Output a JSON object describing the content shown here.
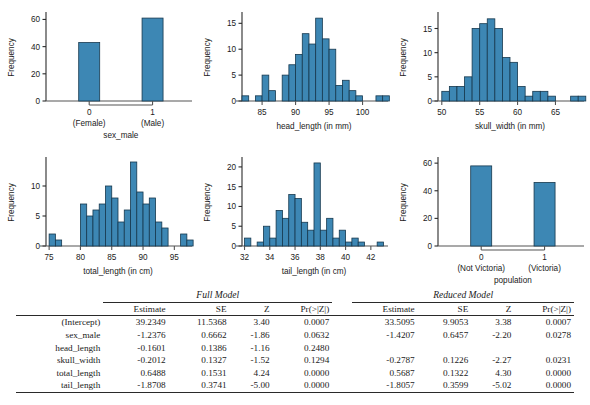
{
  "figure": {
    "shared_ylabel": "Frequency",
    "panels": [
      {
        "id": "sex-male",
        "kind": "bar",
        "xlabel": "sex_male",
        "ylabel": "Frequency",
        "yticks": [
          0,
          20,
          40,
          60
        ],
        "ylim": [
          0,
          64
        ],
        "categories": [
          "0",
          "1"
        ],
        "category_sublabels": [
          "(Female)",
          "(Male)"
        ],
        "values": [
          43,
          61
        ]
      },
      {
        "id": "head-length",
        "kind": "hist",
        "xlabel": "head_length (in mm)",
        "ylabel": "Frequency",
        "yticks": [
          0,
          5,
          10,
          15
        ],
        "ylim": [
          0,
          16.8
        ],
        "xticks": [
          85,
          90,
          95,
          100
        ],
        "xlim": [
          82.0,
          103.5
        ],
        "bin_edges": [
          82.0,
          83.0,
          84.0,
          85.0,
          86.0,
          87.0,
          88.0,
          89.0,
          90.0,
          91.0,
          92.0,
          93.0,
          94.0,
          95.0,
          96.0,
          97.0,
          98.0,
          99.0,
          100.0,
          101.0,
          102.0,
          103.0,
          104.0
        ],
        "values": [
          1,
          0,
          1,
          5,
          2,
          0,
          5,
          7,
          9,
          13,
          11,
          16,
          12,
          10,
          3,
          4,
          2,
          1,
          0,
          0,
          1,
          1
        ]
      },
      {
        "id": "skull-width",
        "kind": "hist",
        "xlabel": "skull_width (in mm)",
        "ylabel": "Frequency",
        "yticks": [
          0,
          5,
          10,
          15
        ],
        "ylim": [
          0,
          18
        ],
        "xticks": [
          50,
          55,
          60,
          65
        ],
        "xlim": [
          49.5,
          68.5
        ],
        "bin_edges": [
          50.0,
          51.0,
          52.0,
          53.0,
          54.0,
          55.0,
          56.0,
          57.0,
          58.0,
          59.0,
          60.0,
          61.0,
          62.0,
          63.0,
          64.0,
          65.0,
          66.0,
          67.0,
          68.0,
          69.0
        ],
        "values": [
          2,
          3,
          3,
          5,
          15,
          16,
          17,
          15,
          9,
          8,
          3,
          1,
          2,
          2,
          1,
          0,
          0,
          1,
          1
        ],
        "bin_width": 1.0,
        "bin_start": 50.0
      },
      {
        "id": "total-length",
        "kind": "hist",
        "xlabel": "total_length (in cm)",
        "ylabel": "Frequency",
        "yticks": [
          0,
          5,
          10
        ],
        "ylim": [
          0,
          14.5
        ],
        "xticks": [
          75,
          80,
          85,
          90,
          95
        ],
        "xlim": [
          74.5,
          97.5
        ],
        "bin_edges": [
          75.0,
          76.0,
          77.0,
          78.0,
          79.0,
          80.0,
          81.0,
          82.0,
          83.0,
          84.0,
          85.0,
          86.0,
          87.0,
          88.0,
          89.0,
          90.0,
          91.0,
          92.0,
          93.0,
          94.0,
          95.0,
          96.0,
          97.0
        ],
        "values": [
          2,
          1,
          0,
          0,
          0,
          7,
          5,
          6,
          7,
          10,
          8,
          4,
          6,
          14,
          9,
          7,
          8,
          4,
          3,
          0,
          0,
          2,
          1
        ],
        "bin_width": 1.0,
        "bin_start": 75.0
      },
      {
        "id": "tail-length",
        "kind": "hist",
        "xlabel": "tail_length (in cm)",
        "ylabel": "Frequency",
        "yticks": [
          0,
          5,
          10,
          15,
          20
        ],
        "ylim": [
          0,
          22
        ],
        "xticks": [
          32,
          34,
          36,
          38,
          40,
          42
        ],
        "xlim": [
          31.8,
          43.2
        ],
        "bin_edges": [
          32.0,
          32.5,
          33.0,
          33.5,
          34.0,
          34.5,
          35.0,
          35.5,
          36.0,
          36.5,
          37.0,
          37.5,
          38.0,
          38.5,
          39.0,
          39.5,
          40.0,
          40.5,
          41.0,
          41.5,
          42.0,
          42.5,
          43.0
        ],
        "values": [
          2,
          0,
          1,
          5,
          2,
          9,
          7,
          13,
          12,
          6,
          4,
          21,
          4,
          7,
          2,
          4,
          1,
          2,
          1,
          0,
          0,
          1
        ],
        "bin_width": 0.5,
        "bin_start": 32.0
      },
      {
        "id": "population",
        "kind": "bar",
        "xlabel": "population",
        "ylabel": "Frequency",
        "yticks": [
          0,
          20,
          40,
          60
        ],
        "ylim": [
          0,
          63
        ],
        "categories": [
          "0",
          "1"
        ],
        "category_sublabels": [
          "(Not Victoria)",
          "(Victoria)"
        ],
        "values": [
          58,
          46
        ]
      }
    ],
    "bar_color": "#3d87b4",
    "bar_edge_color": "#16384e"
  },
  "table": {
    "group_headers": [
      "Full Model",
      "Reduced Model"
    ],
    "columns": [
      "Estimate",
      "SE",
      "Z",
      "Pr(>|Z|)"
    ],
    "rows": [
      {
        "label": "(Intercept)",
        "full": [
          "39.2349",
          "11.5368",
          "3.40",
          "0.0007"
        ],
        "reduced": [
          "33.5095",
          "9.9053",
          "3.38",
          "0.0007"
        ]
      },
      {
        "label": "sex_male",
        "full": [
          "-1.2376",
          "0.6662",
          "-1.86",
          "0.0632"
        ],
        "reduced": [
          "-1.4207",
          "0.6457",
          "-2.20",
          "0.0278"
        ]
      },
      {
        "label": "head_length",
        "full": [
          "-0.1601",
          "0.1386",
          "-1.16",
          "0.2480"
        ],
        "reduced": [
          "",
          "",
          "",
          ""
        ]
      },
      {
        "label": "skull_width",
        "full": [
          "-0.2012",
          "0.1327",
          "-1.52",
          "0.1294"
        ],
        "reduced": [
          "-0.2787",
          "0.1226",
          "-2.27",
          "0.0231"
        ]
      },
      {
        "label": "total_length",
        "full": [
          "0.6488",
          "0.1531",
          "4.24",
          "0.0000"
        ],
        "reduced": [
          "0.5687",
          "0.1322",
          "4.30",
          "0.0000"
        ]
      },
      {
        "label": "tail_length",
        "full": [
          "-1.8708",
          "0.3741",
          "-5.00",
          "0.0000"
        ],
        "reduced": [
          "-1.8057",
          "0.3599",
          "-5.02",
          "0.0000"
        ]
      }
    ]
  }
}
